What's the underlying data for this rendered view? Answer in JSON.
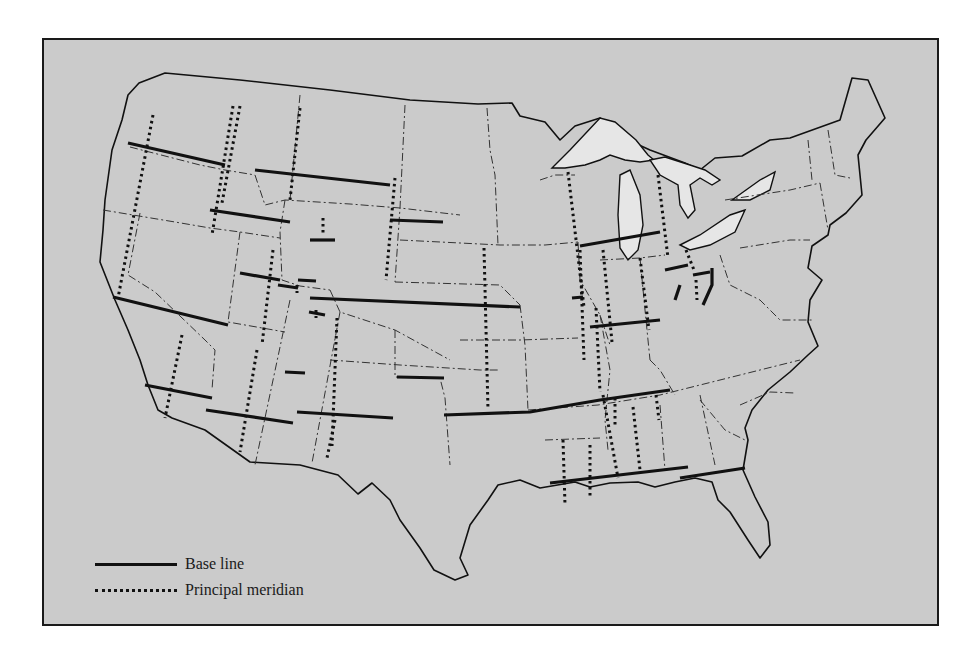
{
  "map": {
    "subject": "Public Land Survey System base lines and principal meridians of the contiguous United States",
    "background_color": "#cbcbcb",
    "land_color": "#cbcbcb",
    "lake_color": "#e6e6e6",
    "line_color": "#111111",
    "border_color": "#1a1a1a"
  },
  "legend": {
    "items": [
      {
        "symbol": "solid-line",
        "label": "Base line"
      },
      {
        "symbol": "dotted-line",
        "label": "Principal meridian"
      }
    ]
  }
}
